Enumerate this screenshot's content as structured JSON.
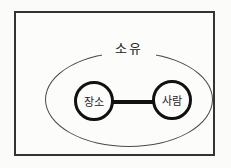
{
  "diagram": {
    "type": "entity-relationship",
    "relationship": {
      "label": "소유"
    },
    "nodes": [
      {
        "id": "place",
        "label": "장소"
      },
      {
        "id": "person",
        "label": "사람"
      }
    ],
    "edge": {
      "from": "장소",
      "to": "사람",
      "style": "thick-line"
    },
    "colors": {
      "background": "#fbfbf9",
      "frame_border": "#333333",
      "ellipse_stroke": "#4a4a4a",
      "node_stroke": "#111111",
      "connector": "#111111",
      "text": "#222222"
    }
  }
}
